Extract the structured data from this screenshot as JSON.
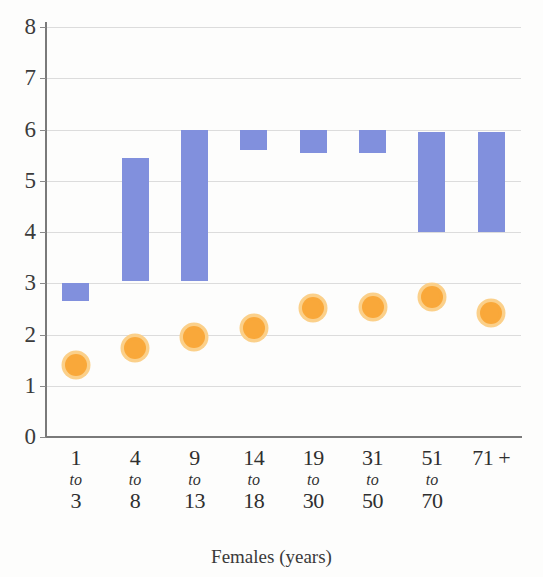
{
  "chart_data": {
    "type": "bar",
    "subtype": "floating-range-bar-with-point-markers",
    "title": "",
    "xlabel": "Females (years)",
    "ylabel": "",
    "ylim": [
      0,
      8
    ],
    "ytick_values": [
      0,
      1,
      2,
      3,
      4,
      5,
      6,
      7,
      8
    ],
    "ytick_labels": [
      "0",
      "1",
      "2",
      "3",
      "4",
      "5",
      "6",
      "7",
      "8"
    ],
    "grid": true,
    "grid_axis": "y",
    "legend": "none",
    "categories": [
      "1 to 3",
      "4 to 8",
      "9 to 13",
      "14 to 18",
      "19 to 30",
      "31 to 50",
      "51 to 70",
      "71 +"
    ],
    "category_labels": [
      {
        "lo": "1",
        "mid": "to",
        "hi": "3"
      },
      {
        "lo": "4",
        "mid": "to",
        "hi": "8"
      },
      {
        "lo": "9",
        "mid": "to",
        "hi": "13"
      },
      {
        "lo": "14",
        "mid": "to",
        "hi": "18"
      },
      {
        "lo": "19",
        "mid": "to",
        "hi": "30"
      },
      {
        "lo": "31",
        "mid": "to",
        "hi": "50"
      },
      {
        "lo": "51",
        "mid": "to",
        "hi": "70"
      },
      {
        "lo": "71 +",
        "mid": "",
        "hi": ""
      }
    ],
    "series": [
      {
        "name": "range-bar",
        "type": "range-bar",
        "color": "#8190dd",
        "low": [
          2.65,
          3.05,
          3.05,
          5.6,
          5.55,
          5.55,
          4.0,
          4.0
        ],
        "high": [
          3.0,
          5.45,
          6.0,
          6.0,
          6.0,
          6.0,
          5.95,
          5.95
        ]
      },
      {
        "name": "point-marker",
        "type": "scatter",
        "color": "#f9a83a",
        "ring_color": "#fbd08a",
        "values": [
          1.4,
          1.73,
          1.95,
          2.13,
          2.52,
          2.54,
          2.73,
          2.41
        ]
      }
    ]
  }
}
